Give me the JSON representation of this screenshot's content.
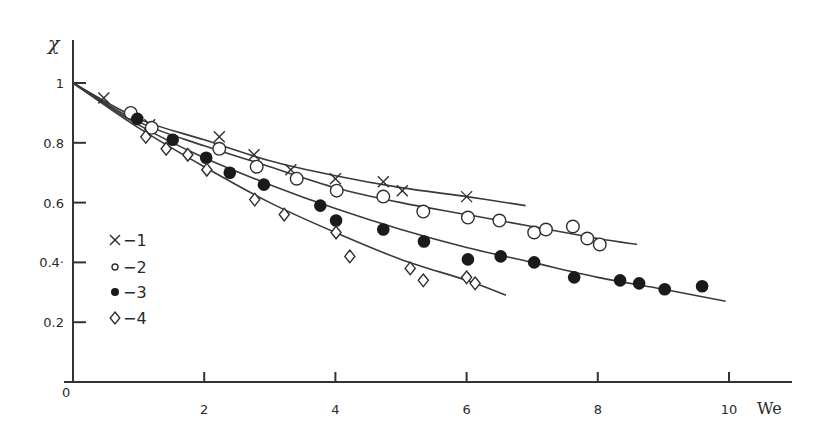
{
  "chart_data": {
    "type": "scatter",
    "title": "",
    "xlabel": "We",
    "ylabel": "χ",
    "xlim": [
      0,
      10.9
    ],
    "ylim": [
      0,
      1.15
    ],
    "x_ticks": [
      2,
      4,
      6,
      8,
      10
    ],
    "y_ticks": [
      0.2,
      0.4,
      0.6,
      0.8,
      1
    ],
    "y_tick_labels": [
      "0.2",
      "0.4·",
      "0.6",
      "0.8",
      "1"
    ],
    "origin_label": "0",
    "grid": false,
    "legend_position": "inside-left",
    "series": [
      {
        "name": "1",
        "legend_label": "×−1",
        "marker": "cross",
        "points": [
          [
            0.47,
            0.95
          ],
          [
            1.17,
            0.86
          ],
          [
            2.23,
            0.82
          ],
          [
            2.76,
            0.76
          ],
          [
            3.32,
            0.71
          ],
          [
            4.0,
            0.68
          ],
          [
            4.73,
            0.67
          ],
          [
            5.02,
            0.64
          ],
          [
            6.0,
            0.62
          ]
        ],
        "fit_curve": [
          [
            0,
            1.0
          ],
          [
            1,
            0.88
          ],
          [
            2,
            0.81
          ],
          [
            3,
            0.74
          ],
          [
            4,
            0.69
          ],
          [
            5,
            0.65
          ],
          [
            6,
            0.62
          ],
          [
            6.9,
            0.59
          ]
        ]
      },
      {
        "name": "2",
        "legend_label": "∘−2",
        "marker": "open-circle",
        "points": [
          [
            0.88,
            0.9
          ],
          [
            1.2,
            0.85
          ],
          [
            2.23,
            0.78
          ],
          [
            2.8,
            0.72
          ],
          [
            3.41,
            0.68
          ],
          [
            4.02,
            0.64
          ],
          [
            4.73,
            0.62
          ],
          [
            5.34,
            0.57
          ],
          [
            6.02,
            0.55
          ],
          [
            6.5,
            0.54
          ],
          [
            7.03,
            0.5
          ],
          [
            7.21,
            0.51
          ],
          [
            7.62,
            0.52
          ],
          [
            7.84,
            0.48
          ],
          [
            8.03,
            0.46
          ]
        ],
        "fit_curve": [
          [
            0,
            1.0
          ],
          [
            1,
            0.87
          ],
          [
            2,
            0.79
          ],
          [
            3,
            0.72
          ],
          [
            4,
            0.65
          ],
          [
            5,
            0.6
          ],
          [
            6,
            0.56
          ],
          [
            7,
            0.52
          ],
          [
            8,
            0.48
          ],
          [
            8.6,
            0.46
          ]
        ]
      },
      {
        "name": "3",
        "legend_label": "●−3",
        "marker": "filled-circle",
        "points": [
          [
            0.98,
            0.88
          ],
          [
            1.52,
            0.81
          ],
          [
            2.03,
            0.75
          ],
          [
            2.39,
            0.7
          ],
          [
            2.91,
            0.66
          ],
          [
            3.77,
            0.59
          ],
          [
            4.01,
            0.54
          ],
          [
            4.73,
            0.51
          ],
          [
            5.35,
            0.47
          ],
          [
            6.02,
            0.41
          ],
          [
            6.52,
            0.42
          ],
          [
            7.03,
            0.4
          ],
          [
            7.64,
            0.35
          ],
          [
            8.34,
            0.34
          ],
          [
            8.63,
            0.33
          ],
          [
            9.02,
            0.31
          ],
          [
            9.59,
            0.32
          ]
        ],
        "fit_curve": [
          [
            0,
            1.0
          ],
          [
            1,
            0.86
          ],
          [
            2,
            0.75
          ],
          [
            3,
            0.66
          ],
          [
            4,
            0.58
          ],
          [
            5,
            0.51
          ],
          [
            6,
            0.45
          ],
          [
            7,
            0.4
          ],
          [
            8,
            0.35
          ],
          [
            9,
            0.31
          ],
          [
            9.95,
            0.27
          ]
        ]
      },
      {
        "name": "4",
        "legend_label": "◊−4",
        "marker": "open-diamond",
        "points": [
          [
            1.11,
            0.82
          ],
          [
            1.42,
            0.78
          ],
          [
            1.75,
            0.76
          ],
          [
            2.04,
            0.71
          ],
          [
            2.77,
            0.61
          ],
          [
            3.22,
            0.56
          ],
          [
            4.01,
            0.5
          ],
          [
            4.22,
            0.42
          ],
          [
            5.14,
            0.38
          ],
          [
            5.34,
            0.34
          ],
          [
            6.0,
            0.35
          ],
          [
            6.13,
            0.33
          ]
        ],
        "fit_curve": [
          [
            0,
            1.0
          ],
          [
            1,
            0.85
          ],
          [
            2,
            0.72
          ],
          [
            3,
            0.6
          ],
          [
            4,
            0.5
          ],
          [
            5,
            0.41
          ],
          [
            6,
            0.34
          ],
          [
            6.6,
            0.29
          ]
        ]
      }
    ]
  },
  "legend": [
    {
      "marker": "cross",
      "label": "−1"
    },
    {
      "marker": "small-open-circle",
      "label": "−2"
    },
    {
      "marker": "filled-circle",
      "label": "−3"
    },
    {
      "marker": "open-diamond",
      "label": "−4"
    }
  ]
}
